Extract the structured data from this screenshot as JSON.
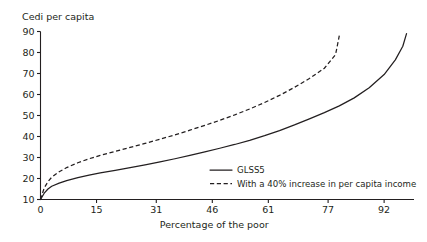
{
  "chart_data": {
    "type": "line",
    "title": "",
    "xlabel": "Percentage of the poor",
    "ylabel": "Cedi per capita",
    "xlim": [
      0,
      100
    ],
    "ylim": [
      10,
      90
    ],
    "xticks": [
      0,
      15,
      31,
      46,
      61,
      77,
      92
    ],
    "xtick_labels": [
      "0",
      "15",
      "31",
      "46",
      "61",
      "77",
      "92"
    ],
    "yticks": [
      10,
      20,
      30,
      40,
      50,
      60,
      70,
      80,
      90
    ],
    "ytick_labels": [
      "10",
      "20",
      "30",
      "40",
      "50",
      "60",
      "70",
      "80",
      "90"
    ],
    "grid": false,
    "legend_position": "bottom-right",
    "series": [
      {
        "name": "GLSS5",
        "style": "solid",
        "color": "#231f20",
        "x": [
          0,
          1,
          2,
          3,
          5,
          7,
          10,
          13,
          16,
          20,
          24,
          28,
          32,
          36,
          40,
          44,
          48,
          52,
          56,
          60,
          64,
          68,
          72,
          76,
          80,
          84,
          88,
          92,
          95,
          97,
          98
        ],
        "y": [
          10.0,
          13.0,
          15.0,
          16.3,
          17.8,
          19.0,
          20.4,
          21.6,
          22.7,
          23.9,
          25.2,
          26.5,
          27.9,
          29.4,
          31.0,
          32.7,
          34.4,
          36.2,
          38.2,
          40.4,
          42.8,
          45.5,
          48.4,
          51.4,
          54.6,
          58.4,
          63.2,
          69.5,
          76.5,
          83.0,
          89.0
        ]
      },
      {
        "name": "With a 40% increase in per capita income",
        "style": "dashed",
        "color": "#231f20",
        "x": [
          0,
          1,
          2,
          3,
          5,
          7,
          10,
          13,
          16,
          20,
          24,
          28,
          32,
          36,
          40,
          44,
          48,
          52,
          56,
          60,
          64,
          68,
          72,
          76,
          79,
          80
        ],
        "y": [
          10.0,
          15.5,
          18.5,
          20.6,
          23.2,
          25.2,
          27.5,
          29.4,
          31.0,
          32.9,
          34.8,
          36.7,
          38.7,
          40.8,
          43.0,
          45.3,
          47.7,
          50.3,
          53.1,
          56.2,
          59.6,
          63.4,
          67.6,
          72.5,
          79.0,
          88.0
        ]
      }
    ]
  },
  "legend": {
    "entries": [
      {
        "label": "GLSS5",
        "style": "solid"
      },
      {
        "label": "With a 40% increase in per capita income",
        "style": "dashed"
      }
    ]
  }
}
